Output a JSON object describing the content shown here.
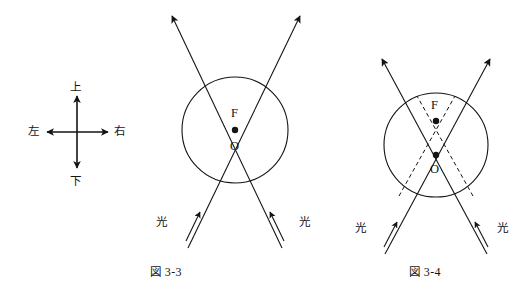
{
  "page": {
    "width": 526,
    "height": 296,
    "background": "#ffffff",
    "ink": "#141414",
    "type": "optics-diagram-figure-pair"
  },
  "orientation_key": {
    "name": "direction-compass",
    "up": "上",
    "down": "下",
    "left": "左",
    "right": "右",
    "center": {
      "x": 77,
      "y": 132
    },
    "arm_length_v": 36,
    "arm_length_h": 31
  },
  "figures": [
    {
      "id": "fig-3-3",
      "caption": "図 3-3",
      "caption_label": "図",
      "caption_number": "3-3",
      "circle": {
        "cx": 235,
        "cy": 130,
        "r": 53
      },
      "points": [
        {
          "name": "F",
          "label": "F",
          "x": 235,
          "y": 130,
          "label_x": 232,
          "label_y": 113,
          "dot": false
        },
        {
          "name": "O",
          "label": "O",
          "x": 235,
          "y": 130,
          "label_x": 231,
          "label_y": 148,
          "dot": true
        }
      ],
      "focus_coincides_with_center": true,
      "rays": [
        {
          "name": "ray-left",
          "label": "光",
          "label_x": 160,
          "label_y": 222,
          "x1": 188,
          "y1": 248,
          "x2": 300,
          "y2": 16,
          "arrow_head": "end",
          "mid_arrow_t": 0.22,
          "dashed": false
        },
        {
          "name": "ray-right",
          "label": "光",
          "label_x": 302,
          "label_y": 222,
          "x1": 282,
          "y1": 248,
          "x2": 172,
          "y2": 16,
          "arrow_head": "end",
          "mid_arrow_t": 0.22,
          "dashed": false
        }
      ],
      "dashed_rays": []
    },
    {
      "id": "fig-3-4",
      "caption": "図 3-4",
      "caption_label": "図",
      "caption_number": "3-4",
      "circle": {
        "cx": 436,
        "cy": 145,
        "r": 52
      },
      "points": [
        {
          "name": "F",
          "label": "F",
          "x": 436,
          "y": 121,
          "label_x": 432,
          "label_y": 105,
          "dot": true
        },
        {
          "name": "O",
          "label": "O",
          "x": 436,
          "y": 155,
          "label_x": 432,
          "label_y": 170,
          "dot": true
        }
      ],
      "focus_coincides_with_center": false,
      "crossing_point": {
        "x": 436,
        "y": 134
      },
      "rays": [
        {
          "name": "ray-left",
          "label": "光",
          "label_x": 360,
          "label_y": 228,
          "x1": 385,
          "y1": 254,
          "x2": 490,
          "y2": 59,
          "arrow_head": "end",
          "mid_arrow_t": 0.21,
          "dashed": false
        },
        {
          "name": "ray-right",
          "label": "光",
          "label_x": 500,
          "label_y": 228,
          "x1": 487,
          "y1": 254,
          "x2": 382,
          "y2": 59,
          "arrow_head": "end",
          "mid_arrow_t": 0.21,
          "dashed": false
        }
      ],
      "dashed_rays": [
        {
          "name": "dashed-converge-left",
          "x1": 399,
          "y1": 196,
          "x2": 455,
          "y2": 96
        },
        {
          "name": "dashed-converge-right",
          "x1": 473,
          "y1": 196,
          "x2": 417,
          "y2": 96
        }
      ]
    }
  ]
}
